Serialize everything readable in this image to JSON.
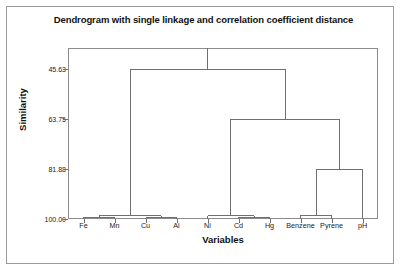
{
  "chart_data": {
    "type": "dendrogram",
    "title": "Dendrogram with single linkage and correlation coefficient distance",
    "xlabel": "Variables",
    "ylabel": "Similarity",
    "categories": [
      "Fe",
      "Mn",
      "Cu",
      "Al",
      "Ni",
      "Cd",
      "Hg",
      "Benzene",
      "Pyrene",
      "pH"
    ],
    "yticks": [
      "45.63",
      "63.75",
      "81.88",
      "100.00"
    ],
    "ytick_values": [
      45.63,
      63.75,
      81.88,
      100.0
    ],
    "ylim": [
      100.0,
      38.0
    ],
    "y_axis_inverted": true,
    "grid": false,
    "legend": "none",
    "line_color": "#6f6f6f",
    "merges": [
      {
        "id": "m1",
        "label": "Fe + Mn",
        "members": [
          "Fe",
          "Mn"
        ],
        "similarity": 99.3
      },
      {
        "id": "m2",
        "label": "Cu + Al",
        "members": [
          "Cu",
          "Al"
        ],
        "similarity": 99.6
      },
      {
        "id": "m3",
        "label": "(Fe,Mn) + (Cu,Al)",
        "members": [
          "Fe",
          "Mn",
          "Cu",
          "Al"
        ],
        "similarity": 98.9
      },
      {
        "id": "m4",
        "label": "Cd + Hg",
        "members": [
          "Cd",
          "Hg"
        ],
        "similarity": 99.3
      },
      {
        "id": "m5",
        "label": "Ni + (Cd,Hg)",
        "members": [
          "Ni",
          "Cd",
          "Hg"
        ],
        "similarity": 98.8
      },
      {
        "id": "m6",
        "label": "Benzene + Pyrene",
        "members": [
          "Benzene",
          "Pyrene"
        ],
        "similarity": 98.7
      },
      {
        "id": "m7",
        "label": "(Benzene,Pyrene) + pH",
        "members": [
          "Benzene",
          "Pyrene",
          "pH"
        ],
        "similarity": 81.88
      },
      {
        "id": "m8",
        "label": "(Ni,Cd,Hg) + (Benzene,Pyrene,pH)",
        "members": [
          "Ni",
          "Cd",
          "Hg",
          "Benzene",
          "Pyrene",
          "pH"
        ],
        "similarity": 63.75
      },
      {
        "id": "m9",
        "label": "root",
        "members": [
          "Fe",
          "Mn",
          "Cu",
          "Al",
          "Ni",
          "Cd",
          "Hg",
          "Benzene",
          "Pyrene",
          "pH"
        ],
        "similarity": 45.63
      }
    ]
  }
}
